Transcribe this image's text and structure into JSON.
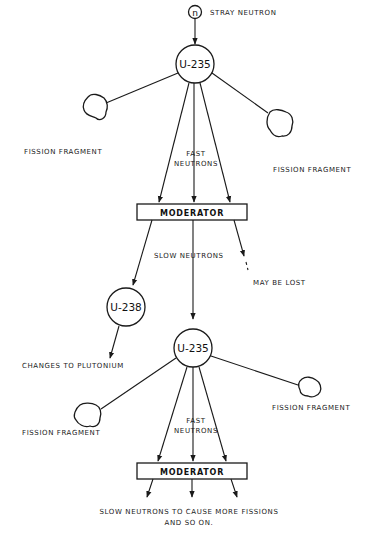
{
  "diagram": {
    "neutron_symbol": "n",
    "labels": {
      "stray_neutron": "STRAY NEUTRON",
      "u235_top": "U-235",
      "fission_fragment_top_left": "FISSION FRAGMENT",
      "fission_fragment_top_right": "FISSION FRAGMENT",
      "fast_neutrons_top_line1": "FAST",
      "fast_neutrons_top_line2": "NEUTRONS",
      "moderator_top": "MODERATOR",
      "slow_neutrons": "SLOW NEUTRONS",
      "may_be_lost": "MAY BE LOST",
      "u238": "U-238",
      "changes_to_plutonium": "CHANGES TO PLUTONIUM",
      "u235_bottom": "U-235",
      "fission_fragment_bottom_left": "FISSION FRAGMENT",
      "fission_fragment_bottom_right": "FISSION FRAGMENT",
      "fast_neutrons_bottom_line1": "FAST",
      "fast_neutrons_bottom_line2": "NEUTRONS",
      "moderator_bottom": "MODERATOR",
      "footer_line1": "SLOW NEUTRONS TO CAUSE MORE FISSIONS",
      "footer_line2": "AND SO ON."
    },
    "nodes": [
      {
        "id": "stray-neutron",
        "type": "neutron"
      },
      {
        "id": "u235-top",
        "type": "nucleus"
      },
      {
        "id": "moderator-top",
        "type": "moderator"
      },
      {
        "id": "u238",
        "type": "nucleus"
      },
      {
        "id": "u235-bottom",
        "type": "nucleus"
      },
      {
        "id": "moderator-bottom",
        "type": "moderator"
      }
    ],
    "edges": [
      {
        "from": "stray-neutron",
        "to": "u235-top"
      },
      {
        "from": "u235-top",
        "to": "fission-fragment-top-left"
      },
      {
        "from": "u235-top",
        "to": "fission-fragment-top-right"
      },
      {
        "from": "u235-top",
        "to": "moderator-top",
        "label": "FAST NEUTRONS",
        "count": 3
      },
      {
        "from": "moderator-top",
        "to": "u238"
      },
      {
        "from": "moderator-top",
        "to": "u235-bottom",
        "label": "SLOW NEUTRONS"
      },
      {
        "from": "moderator-top",
        "to": "lost",
        "label": "MAY BE LOST"
      },
      {
        "from": "u238",
        "to": "plutonium"
      },
      {
        "from": "u235-bottom",
        "to": "fission-fragment-bottom-left"
      },
      {
        "from": "u235-bottom",
        "to": "fission-fragment-bottom-right"
      },
      {
        "from": "u235-bottom",
        "to": "moderator-bottom",
        "label": "FAST NEUTRONS",
        "count": 3
      },
      {
        "from": "moderator-bottom",
        "to": "more-fissions",
        "count": 3
      }
    ]
  }
}
